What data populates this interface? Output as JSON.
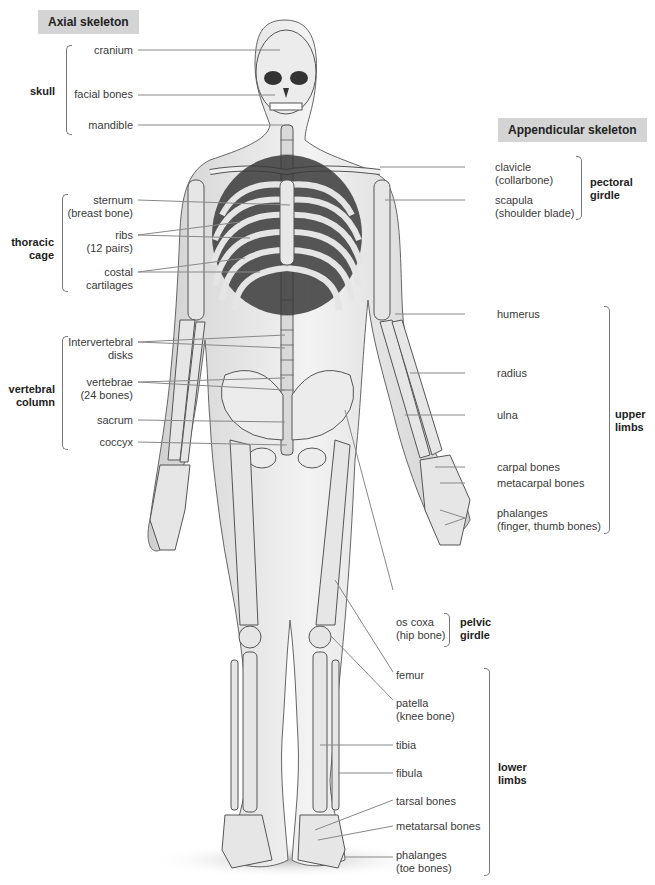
{
  "headers": {
    "axial": "Axial skeleton",
    "appendicular": "Appendicular skeleton"
  },
  "axial_groups": [
    {
      "name": "skull",
      "labels": [
        "cranium",
        "facial bones",
        "mandible"
      ]
    },
    {
      "name": "thoracic cage",
      "labels": [
        "sternum (breast bone)",
        "ribs (12 pairs)",
        "costal cartilages"
      ]
    },
    {
      "name": "vertebral column",
      "labels": [
        "intervertebral disks",
        "vertebrae (24 bones)",
        "sacrum",
        "coccyx"
      ]
    }
  ],
  "appendicular_groups": [
    {
      "name": "pectoral girdle",
      "labels": [
        "clavicle (collarbone)",
        "scapula (shoulder blade)"
      ]
    },
    {
      "name": "upper limbs",
      "labels": [
        "humerus",
        "radius",
        "ulna",
        "carpal bones",
        "metacarpal bones",
        "phalanges (finger, thumb bones)"
      ]
    },
    {
      "name": "pelvic girdle",
      "labels": [
        "os coxa (hip bone)"
      ]
    },
    {
      "name": "lower limbs",
      "labels": [
        "femur",
        "patella (knee bone)",
        "tibia",
        "fibula",
        "tarsal bones",
        "metatarsal bones",
        "phalanges (toe bones)"
      ]
    }
  ],
  "text": {
    "skull": "skull",
    "thoracic1": "thoracic",
    "thoracic2": "cage",
    "vertebral1": "vertebral",
    "vertebral2": "column",
    "pectoral1": "pectoral",
    "pectoral2": "girdle",
    "upper1": "upper",
    "upper2": "limbs",
    "pelvic1": "pelvic",
    "pelvic2": "girdle",
    "lower1": "lower",
    "lower2": "limbs",
    "cranium": "cranium",
    "facial": "facial bones",
    "mandible": "mandible",
    "sternum1": "sternum",
    "sternum2": "(breast bone)",
    "ribs1": "ribs",
    "ribs2": "(12 pairs)",
    "costal1": "costal",
    "costal2": "cartilages",
    "iv1": "Intervertebral",
    "iv2": "disks",
    "vert1": "vertebrae",
    "vert2": "(24 bones)",
    "sacrum": "sacrum",
    "coccyx": "coccyx",
    "clavicle1": "clavicle",
    "clavicle2": "(collarbone)",
    "scapula1": "scapula",
    "scapula2": "(shoulder blade)",
    "humerus": "humerus",
    "radius": "radius",
    "ulna": "ulna",
    "carpal": "carpal bones",
    "metacarpal": "metacarpal bones",
    "phal1": "phalanges",
    "phal2": "(finger, thumb bones)",
    "oscoxa1": "os coxa",
    "oscoxa2": "(hip bone)",
    "femur": "femur",
    "patella1": "patella",
    "patella2": "(knee bone)",
    "tibia": "tibia",
    "fibula": "fibula",
    "tarsal": "tarsal bones",
    "metatarsal": "metatarsal bones",
    "toe1": "phalanges",
    "toe2": "(toe bones)"
  },
  "colors": {
    "header_bg": "#d4d4d4",
    "bone": "#e6e6e6",
    "outline": "#555555",
    "leader": "#888888"
  }
}
